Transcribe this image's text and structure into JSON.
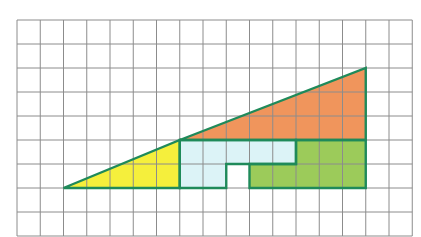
{
  "figure": {
    "grid": {
      "columns": 17,
      "rows": 9,
      "origin_px": [
        17,
        20
      ],
      "cell_w_px": 23.25,
      "cell_h_px": 24,
      "line_color": "#8c8c8c"
    },
    "outline_color": "#1f8a5a",
    "pieces": [
      {
        "name": "yellow-triangle",
        "color": "#f5ef3c",
        "points": [
          [
            2,
            7
          ],
          [
            7,
            5
          ],
          [
            7,
            7
          ]
        ]
      },
      {
        "name": "orange-triangle",
        "color": "#f0955c",
        "points": [
          [
            7,
            5
          ],
          [
            15,
            2
          ],
          [
            15,
            5
          ]
        ]
      },
      {
        "name": "light-blue-piece",
        "color": "#dcf3f7",
        "points": [
          [
            7,
            5
          ],
          [
            12,
            5
          ],
          [
            12,
            6
          ],
          [
            9,
            6
          ],
          [
            9,
            7
          ],
          [
            7,
            7
          ]
        ]
      },
      {
        "name": "green-piece",
        "color": "#9ccb5a",
        "points": [
          [
            12,
            5
          ],
          [
            15,
            5
          ],
          [
            15,
            7
          ],
          [
            10,
            7
          ],
          [
            10,
            6
          ],
          [
            12,
            6
          ]
        ]
      }
    ],
    "hole": {
      "name": "empty-square",
      "cell": [
        9,
        6
      ]
    }
  }
}
